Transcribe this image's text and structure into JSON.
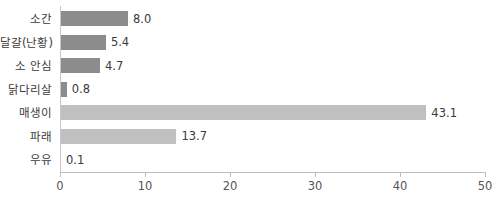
{
  "chart_data": {
    "type": "bar",
    "orientation": "horizontal",
    "title": "",
    "xlabel": "",
    "ylabel": "",
    "xlim": [
      0,
      50
    ],
    "xticks": [
      "0",
      "10",
      "20",
      "30",
      "40",
      "50"
    ],
    "grid": false,
    "legend": false,
    "categories": [
      "소간",
      "달걀(난황)",
      "소 안심",
      "닭다리살",
      "매생이",
      "파래",
      "우유"
    ],
    "values": [
      8.0,
      5.4,
      4.7,
      0.8,
      43.1,
      13.7,
      0.1
    ],
    "value_labels": [
      "8.0",
      "5.4",
      "4.7",
      "0.8",
      "43.1",
      "13.7",
      "0.1"
    ],
    "bar_colors": [
      "#8c8c8c",
      "#8c8c8c",
      "#8c8c8c",
      "#8c8c8c",
      "#c0c0c0",
      "#c0c0c0",
      "#c0c0c0"
    ],
    "bars": [
      {
        "category": "소간",
        "value": 8.0,
        "label": "8.0",
        "color": "#8c8c8c"
      },
      {
        "category": "달걀(난황)",
        "value": 5.4,
        "label": "5.4",
        "color": "#8c8c8c"
      },
      {
        "category": "소 안심",
        "value": 4.7,
        "label": "4.7",
        "color": "#8c8c8c"
      },
      {
        "category": "닭다리살",
        "value": 0.8,
        "label": "0.8",
        "color": "#8c8c8c"
      },
      {
        "category": "매생이",
        "value": 43.1,
        "label": "43.1",
        "color": "#c0c0c0"
      },
      {
        "category": "파래",
        "value": 13.7,
        "label": "13.7",
        "color": "#c0c0c0"
      },
      {
        "category": "우유",
        "value": 0.1,
        "label": "0.1",
        "color": "#c0c0c0"
      }
    ]
  },
  "axis": {
    "x_tick_values": [
      0,
      10,
      20,
      30,
      40,
      50
    ],
    "x_tick_labels": [
      "0",
      "10",
      "20",
      "30",
      "40",
      "50"
    ],
    "axis_color": "#bdbdbd"
  },
  "colors": {
    "background": "#ffffff",
    "bar_dark": "#8c8c8c",
    "bar_light": "#c0c0c0",
    "text": "#3b3b3b",
    "tick_text": "#555555",
    "axis": "#bdbdbd"
  }
}
